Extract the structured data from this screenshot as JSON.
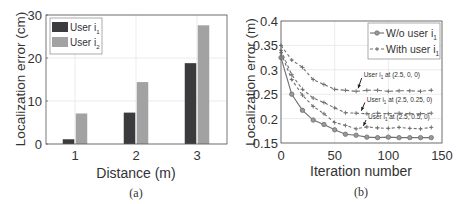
{
  "chart_data": [
    {
      "id": "a",
      "type": "bar",
      "caption": "(a)",
      "title": "",
      "xlabel": "Distance (m)",
      "ylabel": "Localization error (cm)",
      "categories": [
        "1",
        "2",
        "3"
      ],
      "ylim": [
        0,
        30
      ],
      "yticks": [
        0,
        10,
        20,
        30
      ],
      "grid": true,
      "legend_position": "upper-left",
      "series": [
        {
          "name": "User i",
          "subscript": "1",
          "color": "#3b3b3e",
          "values": [
            1.1,
            7.3,
            18.8
          ]
        },
        {
          "name": "User i",
          "subscript": "2",
          "color": "#a2a2a2",
          "values": [
            7.1,
            14.4,
            27.6
          ]
        }
      ]
    },
    {
      "id": "b",
      "type": "line",
      "caption": "(b)",
      "title": "",
      "xlabel": "Iteration number",
      "ylabel": "Localization error (m)",
      "xlim": [
        0,
        150
      ],
      "xticks": [
        0,
        50,
        100,
        150
      ],
      "ylim": [
        0.15,
        0.4
      ],
      "yticks": [
        0.15,
        0.2,
        0.25,
        0.3,
        0.35,
        0.4
      ],
      "ytick_labels": [
        "0.15",
        "0.2",
        "0.25",
        "0.3",
        "0.35",
        "0.4"
      ],
      "grid": true,
      "legend_position": "upper-right",
      "x": [
        0,
        10,
        20,
        30,
        40,
        50,
        60,
        70,
        80,
        90,
        100,
        110,
        120,
        130,
        140
      ],
      "legend": [
        {
          "name": "W/o user i",
          "subscript": "1",
          "style": "solid-circle"
        },
        {
          "name": "With user i",
          "subscript": "1",
          "style": "dashed-plus"
        }
      ],
      "series": [
        {
          "name": "W/o user i1",
          "style": "solid-circle",
          "color": "#707070",
          "values": [
            0.325,
            0.25,
            0.217,
            0.197,
            0.188,
            0.177,
            0.168,
            0.166,
            0.162,
            0.161,
            0.162,
            0.161,
            0.161,
            0.161,
            0.161
          ]
        },
        {
          "name": "With user i1 at (2.5, 0, 0)",
          "style": "dashed-plus",
          "color": "#707070",
          "values": [
            0.35,
            0.32,
            0.305,
            0.28,
            0.27,
            0.26,
            0.258,
            0.256,
            0.258,
            0.258,
            0.256,
            0.257,
            0.257,
            0.256,
            0.258
          ]
        },
        {
          "name": "With user i1 at (2.5, 0.25, 0)",
          "style": "dashed-plus",
          "color": "#707070",
          "values": [
            0.34,
            0.29,
            0.26,
            0.242,
            0.233,
            0.222,
            0.212,
            0.211,
            0.21,
            0.211,
            0.21,
            0.211,
            0.21,
            0.21,
            0.211
          ]
        },
        {
          "name": "With user i1 at (2.5, 0.5, 0)",
          "style": "dashed-plus",
          "color": "#707070",
          "values": [
            0.335,
            0.28,
            0.248,
            0.225,
            0.21,
            0.192,
            0.186,
            0.179,
            0.183,
            0.181,
            0.18,
            0.182,
            0.18,
            0.179,
            0.182
          ]
        }
      ],
      "annotations": [
        {
          "prefix": "User i",
          "subscript": "1",
          "text": "at (2.5, 0, 0)",
          "arrow_to_x": 70,
          "arrow_to_y": 0.258,
          "text_x": 77,
          "text_y": 0.285
        },
        {
          "prefix": "User i",
          "subscript": "1",
          "text": "at (2.5, 0.25, 0)",
          "arrow_to_x": 73,
          "arrow_to_y": 0.212,
          "text_x": 80,
          "text_y": 0.235
        },
        {
          "prefix": "User i",
          "subscript": "1",
          "text": "at (2.5, 0.5, 0)",
          "arrow_to_x": 75,
          "arrow_to_y": 0.181,
          "text_x": 81,
          "text_y": 0.199
        }
      ]
    }
  ]
}
